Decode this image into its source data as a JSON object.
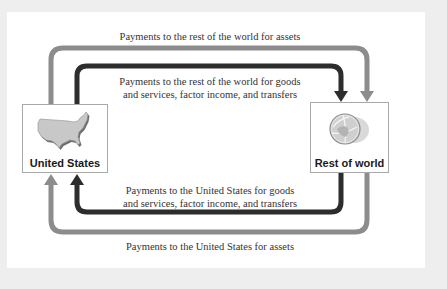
{
  "diagram": {
    "type": "flow",
    "nodes": [
      {
        "id": "us",
        "label": "United States",
        "icon": "us-map-icon"
      },
      {
        "id": "row",
        "label": "Rest of world",
        "icon": "globe-icon"
      }
    ],
    "flows": [
      {
        "id": "us-to-row-assets",
        "from": "us",
        "to": "row",
        "label": "Payments to the rest of the world for assets",
        "color": "#8c8c8c"
      },
      {
        "id": "us-to-row-goods",
        "from": "us",
        "to": "row",
        "label_line1": "Payments to the rest of the world for goods",
        "label_line2": "and services, factor income, and transfers",
        "color": "#2d2d2d"
      },
      {
        "id": "row-to-us-goods",
        "from": "row",
        "to": "us",
        "label_line1": "Payments to the United States for goods",
        "label_line2": "and services, factor income, and transfers",
        "color": "#2d2d2d"
      },
      {
        "id": "row-to-us-assets",
        "from": "row",
        "to": "us",
        "label": "Payments to the United States for assets",
        "color": "#8c8c8c"
      }
    ]
  },
  "colors": {
    "light_arrow": "#8c8c8c",
    "dark_arrow": "#2d2d2d",
    "background": "#eeeeee",
    "panel": "#ffffff"
  }
}
